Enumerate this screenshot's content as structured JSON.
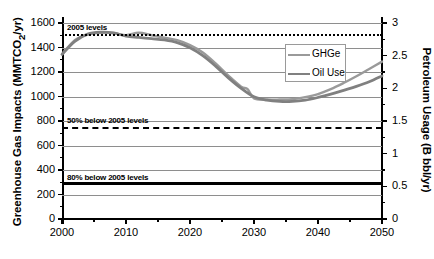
{
  "chart_data": {
    "type": "line",
    "title": "",
    "xlabel": "",
    "ylabel": "Greenhouse Gas Impacts (MMTCO2/yr)",
    "ylabel_right": "Petroleum Usage (B bbl/yr)",
    "xlim": [
      2000,
      2050
    ],
    "ylim": [
      0,
      1600
    ],
    "ylim_right": [
      0,
      3
    ],
    "grid": true,
    "legend_position": "upper-right-inside",
    "xticks": [
      2000,
      2010,
      2020,
      2030,
      2040,
      2050
    ],
    "yticks_left": [
      0,
      200,
      400,
      600,
      800,
      1000,
      1200,
      1400,
      1600
    ],
    "yticks_right": [
      0,
      0.5,
      1,
      1.5,
      2,
      2.5,
      3
    ],
    "series": [
      {
        "name": "GHGe",
        "color": "#9a9a9a",
        "axis": "left",
        "x": [
          2000,
          2002,
          2004,
          2006,
          2008,
          2010,
          2012,
          2014,
          2016,
          2018,
          2020,
          2022,
          2024,
          2026,
          2028,
          2029,
          2030,
          2032,
          2034,
          2036,
          2038,
          2040,
          2042,
          2044,
          2046,
          2048,
          2050
        ],
        "values": [
          1345,
          1460,
          1505,
          1520,
          1518,
          1500,
          1520,
          1500,
          1480,
          1460,
          1420,
          1360,
          1270,
          1170,
          1080,
          1060,
          985,
          975,
          975,
          978,
          995,
          1020,
          1060,
          1110,
          1165,
          1225,
          1285
        ]
      },
      {
        "name": "Oil Use",
        "color": "#808080",
        "axis": "right",
        "x": [
          2000,
          2002,
          2004,
          2006,
          2008,
          2010,
          2012,
          2014,
          2016,
          2018,
          2020,
          2022,
          2024,
          2026,
          2028,
          2030,
          2032,
          2034,
          2036,
          2038,
          2040,
          2042,
          2044,
          2046,
          2048,
          2050
        ],
        "values": [
          2.52,
          2.72,
          2.83,
          2.86,
          2.85,
          2.8,
          2.78,
          2.76,
          2.74,
          2.7,
          2.62,
          2.5,
          2.34,
          2.16,
          2.0,
          1.87,
          1.82,
          1.8,
          1.8,
          1.82,
          1.86,
          1.91,
          1.97,
          2.03,
          2.1,
          2.19
        ]
      }
    ],
    "reference_lines": [
      {
        "name": "2005 levels",
        "label": "2005 levels",
        "value": 1510,
        "style": "dotted",
        "color": "#000000"
      },
      {
        "name": "50% below 2005 levels",
        "label": "50% below 2005 levels",
        "value": 755,
        "style": "dashed",
        "color": "#000000"
      },
      {
        "name": "80% below 2005 levels",
        "label": "80% below 2005 levels",
        "value": 300,
        "style": "solid",
        "color": "#000000"
      }
    ]
  }
}
